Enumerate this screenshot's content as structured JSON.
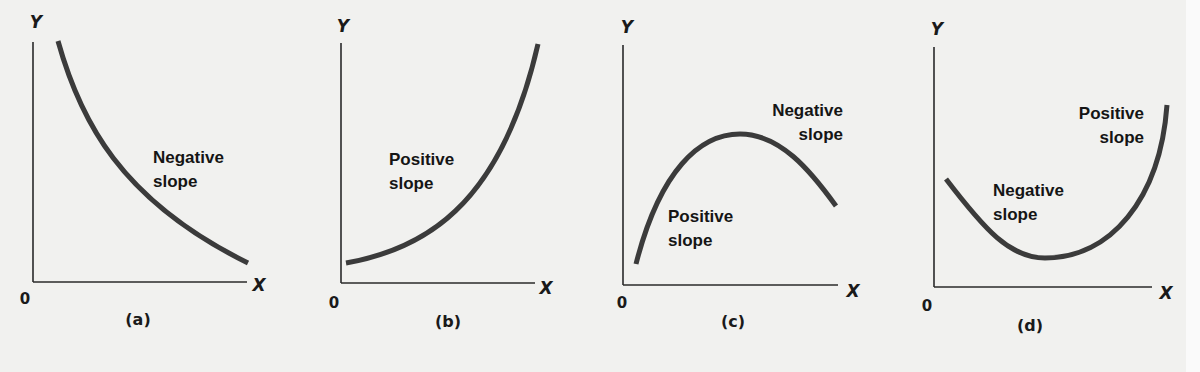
{
  "figure": {
    "background": "#f1f1ef",
    "curve_color": "#3b3b3b",
    "axis_color": "#2a2a2a"
  },
  "panels": [
    {
      "id": "a",
      "caption": "(a)",
      "y_axis_label": "Y",
      "x_axis_label": "X",
      "origin_label": "0",
      "shape": "decreasing convex curve",
      "axes": {
        "x0": 33,
        "y_top": 42,
        "y0": 282,
        "x_end": 247
      },
      "glyphs": {
        "y": [
          36,
          28
        ],
        "x": [
          259,
          291
        ],
        "origin": [
          25,
          304
        ],
        "caption": [
          138,
          325
        ]
      },
      "curve_path": "M 58 41 C 80 120, 120 200, 248 263",
      "labels": [
        {
          "lines": [
            "Negative",
            "slope"
          ],
          "x": 153,
          "y": 163,
          "anchor": "start",
          "line_gap": 24
        }
      ]
    },
    {
      "id": "b",
      "caption": "(b)",
      "y_axis_label": "Y",
      "x_axis_label": "X",
      "origin_label": "0",
      "shape": "increasing convex curve",
      "axes": {
        "x0": 341,
        "y_top": 43,
        "y0": 283,
        "x_end": 535
      },
      "glyphs": {
        "y": [
          343,
          32
        ],
        "x": [
          546,
          294
        ],
        "origin": [
          334,
          308
        ],
        "caption": [
          448,
          327
        ]
      },
      "curve_path": "M 346 263 C 420 250, 500 210, 538 44",
      "labels": [
        {
          "lines": [
            "Positive",
            "slope"
          ],
          "x": 389,
          "y": 165,
          "anchor": "start",
          "line_gap": 24
        }
      ]
    },
    {
      "id": "c",
      "caption": "(c)",
      "y_axis_label": "Y",
      "x_axis_label": "X",
      "origin_label": "0",
      "shape": "inverted U (rises then falls)",
      "axes": {
        "x0": 623,
        "y_top": 45,
        "y0": 285,
        "x_end": 838
      },
      "glyphs": {
        "y": [
          627,
          33
        ],
        "x": [
          853,
          297
        ],
        "origin": [
          622,
          308
        ],
        "caption": [
          733,
          327
        ]
      },
      "curve_path": "M 636 264 C 660 170, 700 134, 740 134 C 780 134, 810 170, 836 206",
      "labels": [
        {
          "lines": [
            "Negative",
            "slope"
          ],
          "x": 843,
          "y": 116,
          "anchor": "end",
          "line_gap": 24
        },
        {
          "lines": [
            "Positive",
            "slope"
          ],
          "x": 668,
          "y": 222,
          "anchor": "start",
          "line_gap": 24
        }
      ]
    },
    {
      "id": "d",
      "caption": "(d)",
      "y_axis_label": "Y",
      "x_axis_label": "X",
      "origin_label": "0",
      "shape": "U shape (falls then rises)",
      "axes": {
        "x0": 934,
        "y_top": 47,
        "y0": 287,
        "x_end": 1152
      },
      "glyphs": {
        "y": [
          937,
          35
        ],
        "x": [
          1166,
          299
        ],
        "origin": [
          927,
          311
        ],
        "caption": [
          1030,
          331
        ]
      },
      "curve_path": "M 946 179 C 985 230, 1010 258, 1045 258 C 1110 258, 1160 200, 1167 105",
      "labels": [
        {
          "lines": [
            "Positive",
            "slope"
          ],
          "x": 1144,
          "y": 119,
          "anchor": "end",
          "line_gap": 24
        },
        {
          "lines": [
            "Negative",
            "slope"
          ],
          "x": 993,
          "y": 196,
          "anchor": "start",
          "line_gap": 24
        }
      ]
    }
  ]
}
